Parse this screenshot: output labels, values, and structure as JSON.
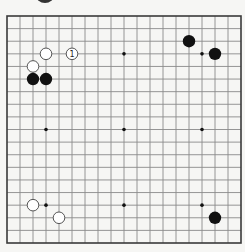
{
  "diagram": {
    "type": "go-board",
    "size": 19,
    "colors": {
      "background": "#f6f6f4",
      "grid_line": "#8a8a8a",
      "border": "#3a3a3a",
      "black_stone": "#111111",
      "white_stone_fill": "#ffffff",
      "white_stone_stroke": "#555555",
      "hoshi": "#111111"
    },
    "hoshi": [
      {
        "col": 3,
        "row": 3
      },
      {
        "col": 9,
        "row": 3
      },
      {
        "col": 15,
        "row": 3
      },
      {
        "col": 3,
        "row": 9
      },
      {
        "col": 9,
        "row": 9
      },
      {
        "col": 15,
        "row": 9
      },
      {
        "col": 3,
        "row": 15
      },
      {
        "col": 9,
        "row": 15
      },
      {
        "col": 15,
        "row": 15
      }
    ],
    "stones": [
      {
        "color": "white",
        "col": 3,
        "row": 3,
        "label": ""
      },
      {
        "color": "white",
        "col": 5,
        "row": 3,
        "label": "1"
      },
      {
        "color": "white",
        "col": 2,
        "row": 4,
        "label": ""
      },
      {
        "color": "black",
        "col": 2,
        "row": 5,
        "label": ""
      },
      {
        "color": "black",
        "col": 3,
        "row": 5,
        "label": ""
      },
      {
        "color": "black",
        "col": 14,
        "row": 2,
        "label": ""
      },
      {
        "color": "black",
        "col": 16,
        "row": 3,
        "label": ""
      },
      {
        "color": "white",
        "col": 2,
        "row": 15,
        "label": ""
      },
      {
        "color": "white",
        "col": 4,
        "row": 16,
        "label": ""
      },
      {
        "color": "black",
        "col": 16,
        "row": 16,
        "label": ""
      }
    ],
    "move_label": "1"
  }
}
